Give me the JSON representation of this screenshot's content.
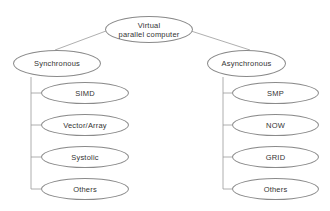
{
  "diagram": {
    "root": {
      "label_line1": "Virtual",
      "label_line2": "parallel computer"
    },
    "branches": [
      {
        "label": "Synchronous",
        "children": [
          "SIMD",
          "Vector/Array",
          "Systolic",
          "Others"
        ]
      },
      {
        "label": "Asynchronous",
        "children": [
          "SMP",
          "NOW",
          "GRID",
          "Others"
        ]
      }
    ],
    "colors": {
      "stroke": "#8a8a8a",
      "text": "#333333",
      "background": "#ffffff"
    }
  }
}
